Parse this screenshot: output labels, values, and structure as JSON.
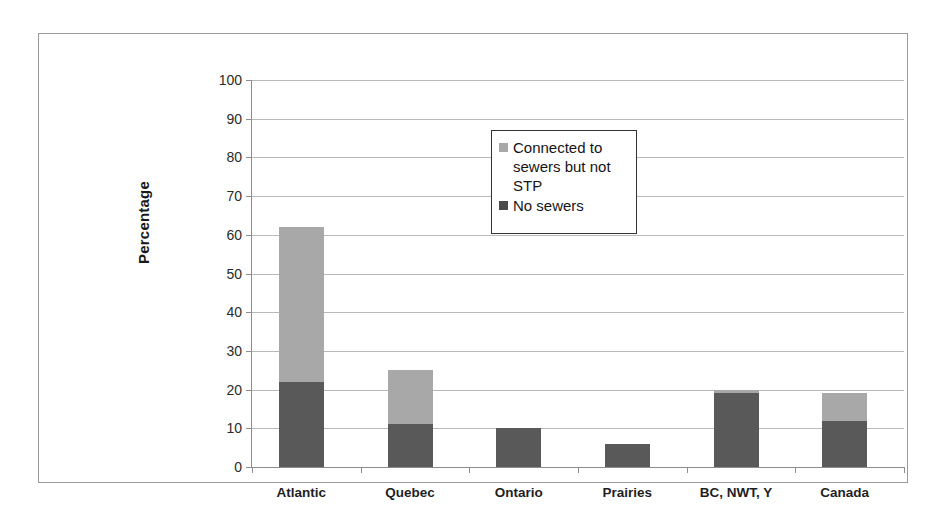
{
  "chart_data": {
    "type": "bar",
    "subtype": "stacked",
    "title": "",
    "xlabel": "",
    "ylabel": "Percentage",
    "ylim": [
      0,
      100
    ],
    "ytick_step": 10,
    "yticks": [
      100,
      90,
      80,
      70,
      60,
      50,
      40,
      30,
      20,
      10,
      0
    ],
    "grid": true,
    "legend_position": "inside-top-center",
    "categories": [
      "Atlantic",
      "Quebec",
      "Ontario",
      "Prairies",
      "BC, NWT, Y",
      "Canada"
    ],
    "series": [
      {
        "name": "No sewers",
        "color": "#595959",
        "values": [
          22,
          11,
          10,
          6,
          19,
          12
        ]
      },
      {
        "name": "Connected to sewers but not STP",
        "color": "#a8a8a8",
        "values": [
          40,
          14,
          0,
          0,
          1,
          7
        ]
      }
    ],
    "totals": [
      62,
      25,
      10,
      6,
      20,
      19
    ]
  },
  "legend": {
    "entries": [
      {
        "label": "Connected to sewers but not STP",
        "swatch": "light"
      },
      {
        "label": "No sewers",
        "swatch": "dark"
      }
    ]
  },
  "colors": {
    "light_gray": "#a8a8a8",
    "dark_gray": "#595959",
    "gridline": "#b9b9b9",
    "axis": "#8d8d8d",
    "frame": "#9a9a9a"
  }
}
